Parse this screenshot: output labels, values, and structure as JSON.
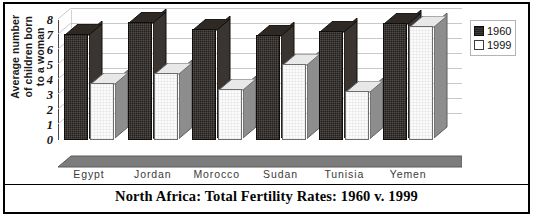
{
  "chart_data": {
    "type": "bar",
    "title": "North Africa: Total Fertility Rates: 1960 v. 1999",
    "xlabel": "",
    "ylabel": "Average number of children born to a woman",
    "ylabel_lines": [
      "Average number",
      "of children born",
      "to a woman"
    ],
    "categories": [
      "Egypt",
      "Jordan",
      "Morocco",
      "Sudan",
      "Tunisia",
      "Yemen"
    ],
    "series": [
      {
        "name": "1960",
        "values": [
          7.1,
          7.9,
          7.4,
          7.0,
          7.25,
          7.8
        ],
        "color": "#231f1c"
      },
      {
        "name": "1999",
        "values": [
          3.8,
          4.5,
          3.4,
          5.1,
          3.3,
          7.6
        ],
        "color": "#fbfbfb"
      }
    ],
    "ylim": [
      0,
      8
    ],
    "yticks": [
      0,
      1,
      2,
      3,
      4,
      5,
      6,
      7,
      8
    ],
    "ytick_labels": [
      "0",
      "1",
      "2",
      "3",
      "4",
      "5",
      "6",
      "7",
      "8"
    ],
    "grid": true,
    "legend_position": "right",
    "style": "3d-column"
  },
  "legend": {
    "entries": [
      {
        "label": "1960",
        "swatch": "filled-dark-square"
      },
      {
        "label": "1999",
        "swatch": "open-light-square"
      }
    ]
  }
}
